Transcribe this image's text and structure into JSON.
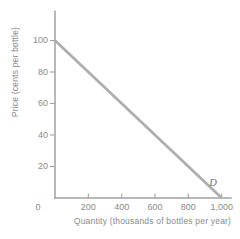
{
  "chart_data": {
    "type": "line",
    "title": "",
    "xlabel": "Quantity (thousands of bottles per year)",
    "ylabel": "Price (cents per bottle)",
    "origin_label": "0",
    "xlim": [
      0,
      1060
    ],
    "ylim": [
      0,
      119
    ],
    "grid": false,
    "legend": false,
    "x_ticks": [
      {
        "v": 200,
        "label": "200"
      },
      {
        "v": 400,
        "label": "400"
      },
      {
        "v": 600,
        "label": "600"
      },
      {
        "v": 800,
        "label": "800"
      },
      {
        "v": 1000,
        "label": "1,000"
      }
    ],
    "y_ticks": [
      {
        "v": 20,
        "label": "20"
      },
      {
        "v": 40,
        "label": "40"
      },
      {
        "v": 60,
        "label": "60"
      },
      {
        "v": 80,
        "label": "80"
      },
      {
        "v": 100,
        "label": "100"
      }
    ],
    "series": [
      {
        "name": "D",
        "description": "demand curve",
        "points": [
          [
            0,
            100
          ],
          [
            1000,
            0
          ]
        ]
      }
    ],
    "colors": {
      "axis": "#a0a0a0",
      "tick_label": "#8a8a8a",
      "line": "#aeaeae",
      "curve_label": "#757575",
      "background": "#ffffff"
    }
  }
}
